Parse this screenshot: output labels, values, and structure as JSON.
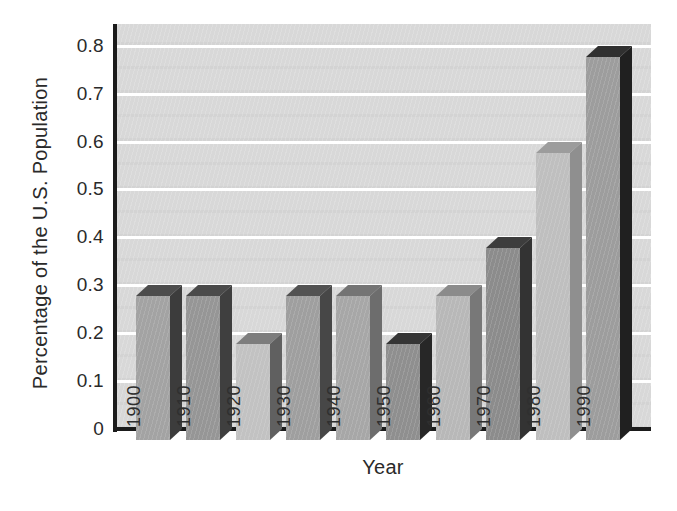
{
  "chart_data": {
    "type": "bar",
    "style": "3d-column",
    "title": "",
    "xlabel": "Year",
    "ylabel": "Percentage of the U.S. Population",
    "categories": [
      "1900",
      "1910",
      "1920",
      "1930",
      "1940",
      "1950",
      "1960",
      "1970",
      "1980",
      "1990"
    ],
    "values": [
      0.3,
      0.3,
      0.2,
      0.3,
      0.3,
      0.2,
      0.3,
      0.4,
      0.6,
      0.8
    ],
    "ylim": [
      0,
      0.85
    ],
    "yticks": [
      0,
      0.1,
      0.2,
      0.3,
      0.4,
      0.5,
      0.6,
      0.7,
      0.8
    ],
    "ytick_labels": [
      "0",
      "0.1",
      "0.2",
      "0.3",
      "0.4",
      "0.5",
      "0.6",
      "0.7",
      "0.8"
    ],
    "grid": "horizontal",
    "legend": "none",
    "bar_year_labels_inside": true,
    "colors": {
      "background": "#ffffff",
      "plot_background": "#d8d8d8",
      "gridline": "#ffffff",
      "axis_line": "#1b1b1b",
      "axis_text": "#2a2a2a",
      "bar_label_text": "#2f2f2f",
      "bars": [
        {
          "year": "1900",
          "front": "#a3a3a3",
          "side": "#3c3c3c",
          "top": "#4c4c4c"
        },
        {
          "year": "1910",
          "front": "#969696",
          "side": "#3f3f3f",
          "top": "#4a4a4a"
        },
        {
          "year": "1920",
          "front": "#c2c2c2",
          "side": "#606060",
          "top": "#7d7d7d"
        },
        {
          "year": "1930",
          "front": "#9f9f9f",
          "side": "#474747",
          "top": "#525252"
        },
        {
          "year": "1940",
          "front": "#a7a7a7",
          "side": "#6d6d6d",
          "top": "#747474"
        },
        {
          "year": "1950",
          "front": "#8f8f8f",
          "side": "#272727",
          "top": "#353535"
        },
        {
          "year": "1960",
          "front": "#b8b8b8",
          "side": "#787878",
          "top": "#8b8b8b"
        },
        {
          "year": "1970",
          "front": "#8c8c8c",
          "side": "#333333",
          "top": "#3d3d3d"
        },
        {
          "year": "1980",
          "front": "#bfbfbf",
          "side": "#8f8f8f",
          "top": "#9c9c9c"
        },
        {
          "year": "1990",
          "front": "#9d9d9d",
          "side": "#202020",
          "top": "#303030"
        }
      ]
    }
  }
}
